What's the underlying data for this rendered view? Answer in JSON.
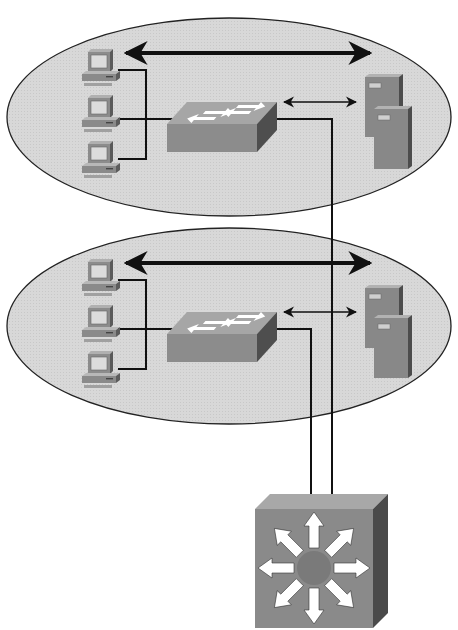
{
  "diagram": {
    "type": "network-topology",
    "colors": {
      "background": "#ffffff",
      "ellipse_fill": "#d6d6d6",
      "ellipse_stroke": "#2a2a2a",
      "device_front": "#8a8a8a",
      "device_top": "#b4b4b4",
      "device_side": "#5c5c5c",
      "link": "#111111",
      "arrow_white": "#ffffff"
    },
    "segments": [
      {
        "id": "segment-1",
        "pcs": [
          "pc-1a",
          "pc-1b",
          "pc-1c"
        ],
        "switch": "workgroup-switch-1",
        "servers": [
          "server-1a",
          "server-1b"
        ]
      },
      {
        "id": "segment-2",
        "pcs": [
          "pc-2a",
          "pc-2b",
          "pc-2c"
        ],
        "switch": "workgroup-switch-2",
        "servers": [
          "server-2a",
          "server-2b"
        ]
      }
    ],
    "core": {
      "id": "multilayer-switch",
      "icon": "layer3-switch-icon"
    },
    "links": [
      {
        "from": "workgroup-switch-1",
        "to": "multilayer-switch"
      },
      {
        "from": "workgroup-switch-2",
        "to": "multilayer-switch"
      }
    ]
  }
}
